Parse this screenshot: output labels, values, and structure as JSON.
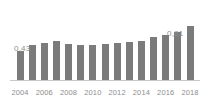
{
  "chart_data": {
    "type": "bar",
    "title": "",
    "subtitle": "",
    "xlabel": "",
    "ylabel": "",
    "categories": [
      "2004",
      "2005",
      "2006",
      "2007",
      "2008",
      "2009",
      "2010",
      "2011",
      "2012",
      "2013",
      "2014",
      "2015",
      "2016",
      "2017",
      "2018"
    ],
    "values": [
      0.43,
      0.52,
      0.55,
      0.59,
      0.54,
      0.52,
      0.52,
      0.54,
      0.55,
      0.57,
      0.59,
      0.64,
      0.68,
      0.72,
      0.81
    ],
    "ylim": [
      0,
      0.9
    ],
    "grid": false,
    "legend": false,
    "tick_labels_x": [
      "2004",
      "2006",
      "2008",
      "2010",
      "2012",
      "2014",
      "2016",
      "2018"
    ],
    "tick_indices_x": [
      0,
      2,
      4,
      6,
      8,
      10,
      12,
      14
    ],
    "data_labels": [
      {
        "index": 0,
        "text": "0,43"
      },
      {
        "index": 14,
        "text": "0,81"
      }
    ],
    "colors": {
      "bar": "#7b7b7b",
      "axis": "#c9c9c9",
      "label_text": "#8d8d8d",
      "background": "#ffffff"
    }
  }
}
